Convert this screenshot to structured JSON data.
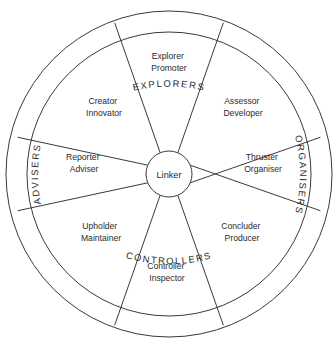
{
  "diagram": {
    "center": {
      "label": "Linker"
    },
    "colors": {
      "line": "#3a3a3a",
      "text": "#2b2b2b",
      "background": "#ffffff"
    },
    "ring_labels": [
      {
        "id": "explorers",
        "text": "EXPLORERS",
        "position": "top"
      },
      {
        "id": "organisers",
        "text": "ORGANISERS",
        "position": "right"
      },
      {
        "id": "controllers",
        "text": "CONTROLLERS",
        "position": "bottom"
      },
      {
        "id": "advisers",
        "text": "ADVISERS",
        "position": "left"
      }
    ],
    "sectors": [
      {
        "id": "explorer-promoter",
        "line1": "Explorer",
        "line2": "Promoter",
        "label_x": 169,
        "label_y": 59
      },
      {
        "id": "assessor-developer",
        "line1": "Assessor",
        "line2": "Developer",
        "label_x": 243,
        "label_y": 104
      },
      {
        "id": "thruster-organiser",
        "line1": "Thruster",
        "line2": "Organiser",
        "label_x": 263,
        "label_y": 160
      },
      {
        "id": "concluder-producer",
        "line1": "Concluder",
        "line2": "Producer",
        "label_x": 242,
        "label_y": 229
      },
      {
        "id": "controller-inspector",
        "line1": "Controller",
        "line2": "Inspector",
        "label_x": 167,
        "label_y": 269
      },
      {
        "id": "upholder-maintainer",
        "line1": "Upholder",
        "line2": "Maintainer",
        "label_x": 101,
        "label_y": 229
      },
      {
        "id": "reporter-adviser",
        "line1": "Reporter",
        "line2": "Adviser",
        "label_x": 84,
        "label_y": 160
      },
      {
        "id": "creator-innovator",
        "line1": "Creator",
        "line2": "Innovator",
        "label_x": 104,
        "label_y": 104
      }
    ]
  }
}
